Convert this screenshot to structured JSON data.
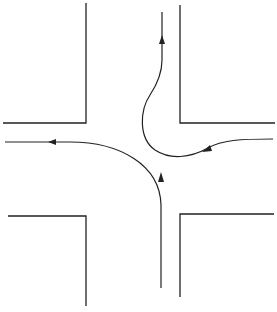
{
  "diagram": {
    "type": "intersection-traffic-paths",
    "colors": {
      "line": "#222222",
      "background": "#ffffff"
    },
    "curbs": [
      {
        "name": "top-left-corner",
        "points": [
          [
            3,
            123
          ],
          [
            86,
            123
          ],
          [
            86,
            3
          ]
        ]
      },
      {
        "name": "top-right-corner",
        "points": [
          [
            180,
            5
          ],
          [
            180,
            123
          ],
          [
            275,
            123
          ]
        ]
      },
      {
        "name": "bottom-left-corner",
        "points": [
          [
            8,
            216
          ],
          [
            86,
            216
          ],
          [
            86,
            306
          ]
        ]
      },
      {
        "name": "bottom-right-corner",
        "points": [
          [
            274,
            214
          ],
          [
            180,
            214
          ],
          [
            180,
            297
          ]
        ]
      }
    ],
    "paths": [
      {
        "name": "left-turn-path",
        "description": "northbound vehicle turning left to westbound"
      },
      {
        "name": "u-turn-path",
        "description": "westbound vehicle making a U-turn to northbound"
      }
    ]
  }
}
